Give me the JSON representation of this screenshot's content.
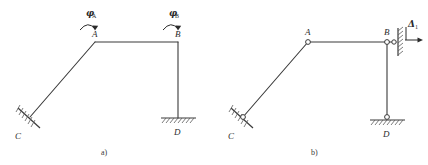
{
  "figure": {
    "kind": "structural-frame-diagram",
    "line_color": "#3a3a3a",
    "text_color": "#2b2b2b",
    "hatch_color": "#5a5a5a",
    "background": "#ffffff"
  },
  "panel_a": {
    "caption": "a)",
    "nodes": {
      "A": "A",
      "B": "B",
      "C": "C",
      "D": "D"
    },
    "rotations": {
      "phi_a_symbol": "φ",
      "phi_a_subscript": "A",
      "phi_b_symbol": "φ",
      "phi_b_subscript": "B"
    },
    "supports": {
      "C": "fixed-inclined-support",
      "D": "fixed-horizontal-support"
    },
    "icons": {
      "moment_arrow_a": "curved-moment-arrow-icon",
      "moment_arrow_b": "curved-moment-arrow-icon",
      "hatching_c": "support-hatching-icon",
      "hatching_d": "support-hatching-icon"
    }
  },
  "panel_b": {
    "caption": "b)",
    "nodes": {
      "A": "A",
      "B": "B",
      "C": "C",
      "D": "D"
    },
    "displacement": {
      "symbol": "Δ",
      "subscript": "1"
    },
    "supports": {
      "C": "pinned-inclined-support",
      "D": "pinned-horizontal-support",
      "B": "roller-vertical-wall-support"
    },
    "icons": {
      "hinge_a": "hinge-circle-icon",
      "hinge_b": "hinge-circle-icon",
      "hinge_b_wall": "hinge-circle-icon",
      "hinge_c": "hinge-circle-icon",
      "hinge_d": "hinge-circle-icon",
      "displacement_arrow": "right-arrow-icon",
      "wall_hatching": "support-hatching-icon",
      "hatching_c": "support-hatching-icon",
      "hatching_d": "support-hatching-icon"
    }
  }
}
